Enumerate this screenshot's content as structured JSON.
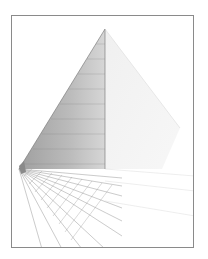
{
  "figure": {
    "kind": "perspective-pyramid-illustration",
    "colors": {
      "frame_border": "#8a8a8a",
      "background": "#ffffff",
      "shaded_face": "#9a9a9a",
      "light_face": "#e6e6e6",
      "grid_lines": "#8c8c8c"
    },
    "geometry": {
      "apex": [
        93,
        13
      ],
      "base_left": [
        7,
        153
      ],
      "base_right": [
        168,
        112
      ],
      "vanishing_point": [
        7,
        153
      ],
      "horizon_y": 153
    }
  }
}
